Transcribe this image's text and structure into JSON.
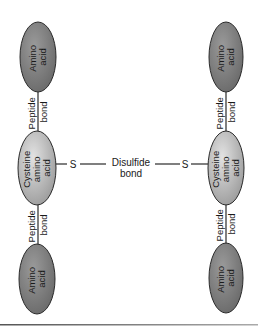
{
  "diagram": {
    "left_chain": {
      "top_residue": {
        "line1": "Amino",
        "line2": "acid"
      },
      "top_bond": {
        "line1": "Peptide",
        "line2": "bond"
      },
      "cysteine": {
        "line1": "Cysteine",
        "line2": "amino",
        "line3": "acid"
      },
      "bottom_bond": {
        "line1": "Peptide",
        "line2": "bond"
      },
      "bottom_residue": {
        "line1": "Amino",
        "line2": "acid"
      },
      "sulfur": "S"
    },
    "right_chain": {
      "top_residue": {
        "line1": "Amino",
        "line2": "acid"
      },
      "top_bond": {
        "line1": "Peptide",
        "line2": "bond"
      },
      "cysteine": {
        "line1": "Cysteine",
        "line2": "amino",
        "line3": "acid"
      },
      "bottom_bond": {
        "line1": "Peptide",
        "line2": "bond"
      },
      "bottom_residue": {
        "line1": "Amino",
        "line2": "acid"
      },
      "sulfur": "S"
    },
    "disulfide": {
      "line1": "Disulfide",
      "line2": "bond"
    },
    "colors": {
      "amino_fill": "#7a7a7a",
      "cysteine_fill_light": "#d4d4d4",
      "cysteine_fill_dark": "#9a9a9a",
      "stroke": "#2a2a2a"
    }
  }
}
